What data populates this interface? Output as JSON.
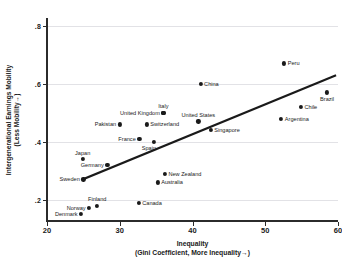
{
  "chart_data": {
    "type": "scatter",
    "title": "",
    "xlabel": "Inequality",
    "xlabel_sub": "(Gini Coefficient, More Inequality→)",
    "ylabel": "Intergenerational Earnings Mobility",
    "ylabel_sub": "(Less Mobility→)",
    "xlim": [
      20,
      60
    ],
    "ylim": [
      0.13,
      0.82
    ],
    "xticks": [
      20,
      30,
      40,
      50,
      60
    ],
    "xticklabels": [
      "20",
      "30",
      "40",
      "50",
      "60"
    ],
    "yticks": [
      0.2,
      0.4,
      0.6,
      0.8
    ],
    "yticklabels": [
      ".2",
      ".4",
      ".6",
      ".8"
    ],
    "grid": "horizontal",
    "legend": "none",
    "marker_color": "#1a1a1a",
    "line_color": "#1a1a1a",
    "points": [
      {
        "label": "Denmark",
        "x": 24.7,
        "y": 0.15,
        "side": "left"
      },
      {
        "label": "Norway",
        "x": 25.8,
        "y": 0.172,
        "side": "left"
      },
      {
        "label": "Finland",
        "x": 26.9,
        "y": 0.18,
        "side": "above"
      },
      {
        "label": "Canada",
        "x": 32.6,
        "y": 0.19,
        "side": "right"
      },
      {
        "label": "Australia",
        "x": 35.2,
        "y": 0.26,
        "side": "right"
      },
      {
        "label": "Sweden",
        "x": 25.0,
        "y": 0.27,
        "side": "left"
      },
      {
        "label": "New Zealand",
        "x": 36.2,
        "y": 0.29,
        "side": "right"
      },
      {
        "label": "Germany",
        "x": 28.3,
        "y": 0.32,
        "side": "left"
      },
      {
        "label": "Japan",
        "x": 24.9,
        "y": 0.34,
        "side": "above"
      },
      {
        "label": "Spain",
        "x": 34.7,
        "y": 0.4,
        "side": "above-left"
      },
      {
        "label": "France",
        "x": 32.7,
        "y": 0.41,
        "side": "left"
      },
      {
        "label": "Singapore",
        "x": 42.5,
        "y": 0.44,
        "side": "right"
      },
      {
        "label": "Pakistan",
        "x": 30.0,
        "y": 0.46,
        "side": "left"
      },
      {
        "label": "Switzerland",
        "x": 33.7,
        "y": 0.46,
        "side": "right"
      },
      {
        "label": "United States",
        "x": 40.8,
        "y": 0.47,
        "side": "above"
      },
      {
        "label": "United Kingdom",
        "x": 36.0,
        "y": 0.5,
        "side": "left"
      },
      {
        "label": "Italy",
        "x": 36.0,
        "y": 0.5,
        "side": "above"
      },
      {
        "label": "Argentina",
        "x": 52.2,
        "y": 0.48,
        "side": "right"
      },
      {
        "label": "Chile",
        "x": 54.9,
        "y": 0.52,
        "side": "right"
      },
      {
        "label": "Brazil",
        "x": 58.5,
        "y": 0.57,
        "side": "below"
      },
      {
        "label": "China",
        "x": 41.1,
        "y": 0.6,
        "side": "right"
      },
      {
        "label": "Peru",
        "x": 52.6,
        "y": 0.67,
        "side": "right"
      }
    ],
    "trendline": {
      "x1": 25.1,
      "y1": 0.272,
      "x2": 59.6,
      "y2": 0.628
    }
  }
}
